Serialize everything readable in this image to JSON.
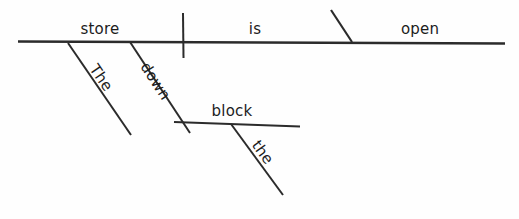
{
  "diagram": {
    "kind": "reed-kellogg-sentence-diagram",
    "canvas": {
      "width": 519,
      "height": 219,
      "background": "#fefefe"
    },
    "ink_color": "#2b2b2b",
    "text_color": "#1c1c1c",
    "sentence": "The store down the block is open",
    "words": [
      {
        "id": "subject",
        "text": "store",
        "role": "subject",
        "orientation": "horizontal",
        "x": 100,
        "y": 22,
        "rotation": 0,
        "font_size": 15
      },
      {
        "id": "verb",
        "text": "is",
        "role": "linking-verb",
        "orientation": "horizontal",
        "x": 255,
        "y": 22,
        "rotation": 0,
        "font_size": 15
      },
      {
        "id": "complement",
        "text": "open",
        "role": "predicate-adjective",
        "orientation": "horizontal",
        "x": 420,
        "y": 22,
        "rotation": 0,
        "font_size": 15
      },
      {
        "id": "article-the-subject",
        "text": "The",
        "role": "article-modifier",
        "orientation": "diagonal",
        "x": 99,
        "y": 62,
        "rotation": 56,
        "font_size": 15
      },
      {
        "id": "preposition-down",
        "text": "down",
        "role": "preposition",
        "orientation": "diagonal",
        "x": 150,
        "y": 60,
        "rotation": 57,
        "font_size": 15
      },
      {
        "id": "object-block",
        "text": "block",
        "role": "object-of-preposition",
        "orientation": "horizontal",
        "x": 232,
        "y": 104,
        "rotation": 0,
        "font_size": 15
      },
      {
        "id": "article-the-object",
        "text": "the",
        "role": "article-modifier",
        "orientation": "diagonal",
        "x": 261,
        "y": 138,
        "rotation": 54,
        "font_size": 15
      }
    ],
    "strokes": [
      {
        "id": "baseline",
        "name": "main-baseline",
        "x1": 18,
        "y1": 41.5,
        "x2": 505,
        "y2": 43.5,
        "width": 2.4
      },
      {
        "id": "subject-verb-divider",
        "name": "subject-verb-divider",
        "x1": 183,
        "y1": 13,
        "x2": 183.5,
        "y2": 58,
        "width": 2.0
      },
      {
        "id": "complement-slash",
        "name": "predicate-adjective-slant",
        "x1": 331,
        "y1": 10,
        "x2": 352,
        "y2": 42,
        "width": 2.2
      },
      {
        "id": "the-subject-modifier",
        "name": "article-slant-subject",
        "x1": 68,
        "y1": 43,
        "x2": 131,
        "y2": 135,
        "width": 2.0
      },
      {
        "id": "down-preposition-slant",
        "name": "preposition-slant",
        "x1": 130,
        "y1": 42,
        "x2": 190,
        "y2": 133,
        "width": 2.0
      },
      {
        "id": "prep-object-baseline",
        "name": "prepositional-object-line",
        "x1": 174,
        "y1": 122,
        "x2": 300,
        "y2": 126.5,
        "width": 2.2
      },
      {
        "id": "the-object-modifier",
        "name": "article-slant-object",
        "x1": 231,
        "y1": 124,
        "x2": 283,
        "y2": 195,
        "width": 2.0
      }
    ]
  }
}
